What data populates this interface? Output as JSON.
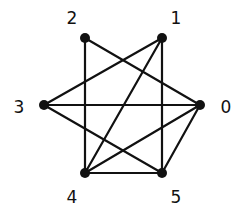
{
  "diagram": {
    "type": "undirected-graph",
    "colors": {
      "background": "#ffffff",
      "edge": "#111111",
      "node": "#111111",
      "label": "#111111"
    },
    "nodes": [
      {
        "id": "0",
        "label": "0",
        "x": 200,
        "y": 105,
        "label_x": 226,
        "label_y": 107
      },
      {
        "id": "1",
        "label": "1",
        "x": 162,
        "y": 38,
        "label_x": 176,
        "label_y": 18
      },
      {
        "id": "2",
        "label": "2",
        "x": 85,
        "y": 38,
        "label_x": 72,
        "label_y": 18
      },
      {
        "id": "3",
        "label": "3",
        "x": 44,
        "y": 105,
        "label_x": 19,
        "label_y": 107
      },
      {
        "id": "4",
        "label": "4",
        "x": 85,
        "y": 173,
        "label_x": 72,
        "label_y": 197
      },
      {
        "id": "5",
        "label": "5",
        "x": 162,
        "y": 173,
        "label_x": 176,
        "label_y": 197
      }
    ],
    "edges": [
      [
        "2",
        "4"
      ],
      [
        "2",
        "0"
      ],
      [
        "1",
        "3"
      ],
      [
        "1",
        "4"
      ],
      [
        "1",
        "5"
      ],
      [
        "3",
        "0"
      ],
      [
        "3",
        "5"
      ],
      [
        "0",
        "4"
      ],
      [
        "0",
        "5"
      ],
      [
        "4",
        "5"
      ]
    ]
  }
}
